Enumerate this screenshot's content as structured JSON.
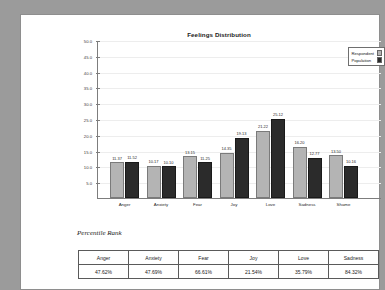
{
  "chart_data": {
    "type": "bar",
    "title": "Feelings Distribution",
    "xlabel": "",
    "ylabel": "",
    "ylim": [
      0,
      50
    ],
    "ytick_step": 5,
    "yticks": [
      "5.0",
      "10.0",
      "15.0",
      "20.0",
      "25.0",
      "30.0",
      "35.0",
      "40.0",
      "45.0",
      "50.0"
    ],
    "grid": true,
    "legend_position": "top-right",
    "categories": [
      "Anger",
      "Anxiety",
      "Fear",
      "Joy",
      "Love",
      "Sadness",
      "Shame"
    ],
    "series": [
      {
        "name": "Respondent",
        "color": "#b4b4b4",
        "values": [
          11.37,
          10.17,
          13.15,
          14.35,
          21.22,
          16.2,
          13.5
        ]
      },
      {
        "name": "Population",
        "color": "#2b2b2b",
        "values": [
          11.52,
          10.1,
          11.25,
          19.13,
          25.12,
          12.77,
          10.16
        ]
      }
    ]
  },
  "legend": {
    "items": [
      {
        "label": "Respondent",
        "swatch": "#b4b4b4"
      },
      {
        "label": "Population",
        "swatch": "#2b2b2b"
      }
    ]
  },
  "percentile_section": {
    "heading": "Percentile Rank",
    "columns": [
      "Anger",
      "Anxiety",
      "Fear",
      "Joy",
      "Love",
      "Sadness"
    ],
    "values": [
      "47.62%",
      "47.69%",
      "66.61%",
      "21.54%",
      "35.79%",
      "84.32%"
    ]
  }
}
